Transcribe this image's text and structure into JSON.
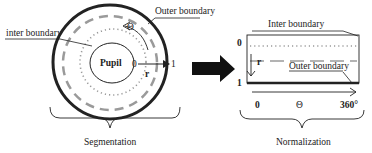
{
  "segmentation": {
    "caption": "Segmentation",
    "outer_boundary_label": "Outer boundary",
    "inter_boundary_label": "inter boundary",
    "pupil_label": "Pupil",
    "theta_label": "Θ",
    "r_label": "r",
    "r_start": "0",
    "r_end": "1"
  },
  "normalization": {
    "caption": "Normalization",
    "inter_boundary_label": "Inter boundary",
    "outer_boundary_label": "Outer boundary",
    "r_label": "r",
    "r_top": "0",
    "r_bottom": "1",
    "theta_start": "0",
    "theta_label": "Θ",
    "theta_end": "360°"
  },
  "colors": {
    "line": "#222222",
    "dashed_ring": "#9a9a9a",
    "dotted_ring": "#9a9a9a"
  }
}
